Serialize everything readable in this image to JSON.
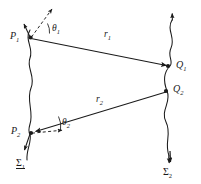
{
  "figure": {
    "background_color": "#ffffff",
    "stroke_color": "#1a1a1a",
    "width": 201,
    "height": 184
  },
  "points": {
    "p1": {
      "label": "P",
      "subscript": "1",
      "x": 28,
      "y": 37
    },
    "p2": {
      "label": "P",
      "subscript": "2",
      "x": 30,
      "y": 133
    },
    "q1": {
      "label": "Q",
      "subscript": "1",
      "x": 170,
      "y": 66
    },
    "q2": {
      "label": "Q",
      "subscript": "2",
      "x": 167,
      "y": 91
    }
  },
  "rays": {
    "r1": {
      "label": "r",
      "subscript": "1",
      "from": "P1",
      "to": "Q1"
    },
    "r2": {
      "label": "r",
      "subscript": "2",
      "from": "Q2",
      "to": "P2"
    }
  },
  "angles": {
    "theta1": {
      "label": "θ",
      "subscript": "1",
      "at": "P1"
    },
    "theta2": {
      "label": "θ",
      "subscript": "2",
      "at": "P2"
    }
  },
  "surfaces": {
    "sigma1": {
      "label": "Σ",
      "subscript": "1",
      "underlined": true
    },
    "sigma2": {
      "label": "Σ",
      "subscript": "2",
      "underlined": false
    }
  },
  "normals": {
    "p1_solid": "solid arrow up-left at P1",
    "p1_dashed": "dashed arrow up-right at P1",
    "p2_solid": "solid arrow down-left at P2",
    "p2_dashed": "dashed arrow right at P2"
  }
}
